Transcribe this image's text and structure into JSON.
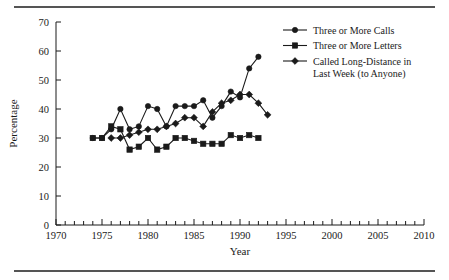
{
  "figure": {
    "top_rule": "",
    "bottom_rule": ""
  },
  "chart_data": {
    "type": "line",
    "title": "",
    "xlabel": "Year",
    "ylabel": "Percentage",
    "xlim": [
      1970,
      2010
    ],
    "ylim": [
      0,
      70
    ],
    "xticks": [
      1970,
      1975,
      1980,
      1985,
      1990,
      1995,
      2000,
      2005,
      2010
    ],
    "xtick_labels": [
      "1970",
      "1975",
      "1980",
      "1985",
      "1990",
      "1995",
      "2000",
      "2005",
      "2010"
    ],
    "xminor_step": 1,
    "yticks": [
      0,
      10,
      20,
      30,
      40,
      50,
      60,
      70
    ],
    "ytick_labels": [
      "0",
      "10",
      "20",
      "30",
      "40",
      "50",
      "60",
      "70"
    ],
    "grid": false,
    "legend_position": "upper right",
    "series": [
      {
        "name": "Three or More Calls",
        "marker": "circle",
        "x": [
          1974,
          1975,
          1976,
          1977,
          1978,
          1979,
          1980,
          1981,
          1982,
          1983,
          1984,
          1985,
          1986,
          1987,
          1988,
          1989,
          1990,
          1991,
          1992
        ],
        "values": [
          30,
          30,
          33,
          40,
          33,
          34,
          41,
          40,
          34,
          41,
          41,
          41,
          43,
          37,
          41,
          46,
          44,
          54,
          58
        ]
      },
      {
        "name": "Three or More Letters",
        "marker": "square",
        "x": [
          1974,
          1975,
          1976,
          1977,
          1978,
          1979,
          1980,
          1981,
          1982,
          1983,
          1984,
          1985,
          1986,
          1987,
          1988,
          1989,
          1990,
          1991,
          1992
        ],
        "values": [
          30,
          30,
          34,
          33,
          26,
          27,
          30,
          26,
          27,
          30,
          30,
          29,
          28,
          28,
          28,
          31,
          30,
          31,
          30
        ]
      },
      {
        "name": "Called Long-Distance in Last Week (to Anyone)",
        "marker": "diamond",
        "x": [
          1976,
          1977,
          1978,
          1979,
          1980,
          1981,
          1982,
          1983,
          1984,
          1985,
          1986,
          1987,
          1988,
          1989,
          1990,
          1991,
          1992,
          1993
        ],
        "values": [
          30,
          30,
          31,
          32,
          33,
          33,
          34,
          35,
          37,
          37,
          34,
          39,
          42,
          43,
          45,
          45,
          42,
          38
        ]
      }
    ]
  }
}
